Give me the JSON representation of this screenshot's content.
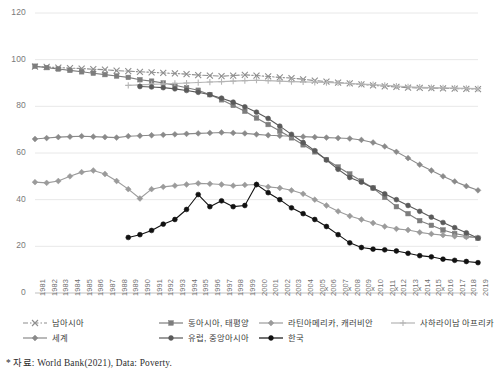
{
  "source_note": "* 자료: World Bank(2021), Data: Poverty.",
  "axes": {
    "y_ticks": [
      0,
      20,
      40,
      60,
      80,
      100,
      120
    ],
    "ylim": [
      0,
      120
    ],
    "ylabel": "",
    "xlabel": "",
    "grid": true
  },
  "legend": {
    "position": "bottom",
    "entries": [
      {
        "label": "남아시아",
        "color": "#8e8e8e",
        "marker": "x",
        "dash": "dashdot",
        "row": 0,
        "col": 0
      },
      {
        "label": "동아시아, 태평양",
        "color": "#7d7d7d",
        "marker": "square",
        "dash": "solid",
        "row": 0,
        "col": 1
      },
      {
        "label": "라틴아메리카, 캐러비안",
        "color": "#9b9b9b",
        "marker": "diamond",
        "dash": "solid",
        "row": 0,
        "col": 2
      },
      {
        "label": "사하라이남 아프리카",
        "color": "#b5b5b5",
        "marker": "plus",
        "dash": "solid",
        "row": 0,
        "col": 3
      },
      {
        "label": "세계",
        "color": "#8a8a8a",
        "marker": "diamond",
        "dash": "solid",
        "row": 1,
        "col": 0
      },
      {
        "label": "유럽, 중앙아시아",
        "color": "#5a5a5a",
        "marker": "circle",
        "dash": "solid",
        "row": 1,
        "col": 1
      },
      {
        "label": "한국",
        "color": "#111111",
        "marker": "circle",
        "dash": "solid",
        "row": 1,
        "col": 2
      }
    ]
  },
  "chart_data": {
    "type": "line",
    "title": "",
    "xlabel": "",
    "ylabel": "",
    "ylim": [
      0,
      120
    ],
    "grid": true,
    "legend_position": "bottom",
    "categories": [
      "1981",
      "1982",
      "1983",
      "1984",
      "1985",
      "1986",
      "1987",
      "1988",
      "1989",
      "1990",
      "1991",
      "1992",
      "1993",
      "1994",
      "1995",
      "1996",
      "1997",
      "1998",
      "1999",
      "2000",
      "2001",
      "2002",
      "2003",
      "2004",
      "2005",
      "2006",
      "2007",
      "2008",
      "2009",
      "2010",
      "2011",
      "2012",
      "2013",
      "2014",
      "2015",
      "2016",
      "2017",
      "2018",
      "2019"
    ],
    "series": [
      {
        "name": "남아시아",
        "color": "#8e8e8e",
        "marker": "x",
        "dash": "dashdot",
        "values": [
          97.0,
          96.9,
          96.6,
          96.4,
          96.2,
          95.9,
          95.7,
          95.3,
          95.1,
          94.8,
          94.6,
          94.3,
          94.1,
          93.8,
          93.4,
          93.2,
          92.9,
          93.2,
          93.5,
          93.2,
          92.8,
          92.4,
          92.1,
          91.6,
          91.0,
          90.6,
          90.2,
          89.8,
          89.4,
          89.0,
          88.6,
          88.3,
          88.0,
          87.9,
          87.8,
          87.7,
          87.6,
          87.5,
          87.4
        ]
      },
      {
        "name": "동아시아, 태평양",
        "color": "#7d7d7d",
        "marker": "square",
        "dash": "solid",
        "values": [
          97.2,
          96.6,
          96.0,
          95.4,
          94.8,
          94.2,
          93.6,
          93.0,
          92.4,
          91.4,
          90.8,
          90.0,
          89.0,
          88.0,
          86.9,
          85.0,
          82.8,
          80.4,
          77.9,
          75.0,
          72.2,
          69.4,
          66.5,
          63.5,
          60.5,
          57.2,
          54.0,
          51.0,
          48.0,
          45.0,
          41.0,
          37.0,
          34.0,
          31.0,
          29.0,
          27.0,
          25.5,
          24.5,
          23.5
        ]
      },
      {
        "name": "라틴아메리카, 캐러비안",
        "color": "#9b9b9b",
        "marker": "diamond",
        "dash": "solid",
        "values": [
          47.5,
          47.2,
          48.0,
          50.0,
          51.8,
          52.5,
          51.0,
          48.0,
          44.5,
          40.5,
          44.5,
          45.5,
          46.0,
          46.5,
          47.0,
          46.8,
          46.5,
          46.0,
          46.3,
          46.5,
          45.5,
          45.0,
          44.0,
          42.5,
          40.0,
          37.5,
          35.0,
          33.0,
          31.5,
          30.0,
          28.5,
          27.5,
          27.0,
          26.0,
          25.3,
          24.8,
          24.3,
          24.0,
          23.7
        ]
      },
      {
        "name": "사하라이남 아프리카",
        "color": "#b5b5b5",
        "marker": "plus",
        "dash": "solid",
        "values": [
          null,
          null,
          null,
          null,
          null,
          null,
          null,
          null,
          89.0,
          89.2,
          89.4,
          89.6,
          89.8,
          90.0,
          90.2,
          90.4,
          90.6,
          90.8,
          91.0,
          91.2,
          91.0,
          90.8,
          90.6,
          90.5,
          90.3,
          90.2,
          90.0,
          89.8,
          89.5,
          89.3,
          89.0,
          88.7,
          88.4,
          88.2,
          88.0,
          87.9,
          87.8,
          87.7,
          87.6
        ]
      },
      {
        "name": "세계",
        "color": "#8a8a8a",
        "marker": "diamond",
        "dash": "solid",
        "values": [
          66.0,
          66.4,
          66.8,
          67.0,
          67.2,
          67.0,
          66.8,
          66.6,
          67.2,
          67.4,
          67.6,
          67.8,
          68.0,
          68.2,
          68.4,
          68.6,
          68.8,
          68.6,
          68.4,
          68.0,
          67.6,
          67.4,
          67.2,
          67.0,
          66.8,
          66.6,
          66.4,
          66.2,
          65.6,
          64.5,
          62.8,
          60.5,
          57.8,
          55.0,
          52.5,
          50.0,
          47.8,
          45.8,
          44.0
        ]
      },
      {
        "name": "유럽, 중앙아시아",
        "color": "#5a5a5a",
        "marker": "circle",
        "dash": "solid",
        "values": [
          null,
          null,
          null,
          null,
          null,
          null,
          null,
          null,
          null,
          88.5,
          88.3,
          88.0,
          87.5,
          86.8,
          86.0,
          85.0,
          83.5,
          81.8,
          79.8,
          77.5,
          74.8,
          71.5,
          68.0,
          64.5,
          61.0,
          57.0,
          53.0,
          49.5,
          47.5,
          45.0,
          42.5,
          40.0,
          37.5,
          35.0,
          32.5,
          30.2,
          28.0,
          25.8,
          23.5
        ]
      },
      {
        "name": "한국",
        "color": "#111111",
        "marker": "circle",
        "dash": "solid",
        "values": [
          null,
          null,
          null,
          null,
          null,
          null,
          null,
          null,
          23.8,
          25.0,
          26.8,
          29.5,
          31.5,
          35.8,
          42.2,
          37.0,
          39.5,
          37.0,
          37.5,
          46.5,
          43.0,
          40.0,
          36.5,
          34.0,
          31.5,
          28.5,
          25.0,
          21.5,
          19.5,
          18.8,
          18.5,
          18.0,
          17.0,
          16.0,
          15.5,
          14.5,
          14.0,
          13.5,
          13.0
        ]
      }
    ],
    "axis_marks": {
      "glyph": "x",
      "years": [
        "2006",
        "2008",
        "2010",
        "2012",
        "2014",
        "2016"
      ]
    }
  }
}
